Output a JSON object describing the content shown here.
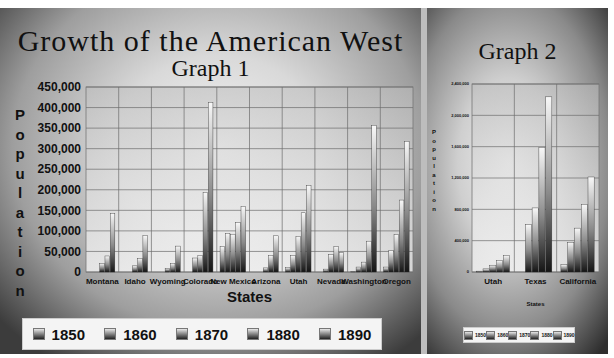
{
  "graph1": {
    "title": "Growth of the American West",
    "subtitle": "Graph 1",
    "ylabel": "Population",
    "xlabel": "States",
    "legend": [
      "1850",
      "1860",
      "1870",
      "1880",
      "1890"
    ]
  },
  "graph2": {
    "title": "Graph 2",
    "ylabel": "Population",
    "xlabel": "States",
    "legend": [
      "1850",
      "1860",
      "1870",
      "1880",
      "1890"
    ]
  },
  "chart_data": [
    {
      "type": "bar",
      "title": "Growth of the American West — Graph 1",
      "xlabel": "States",
      "ylabel": "Population",
      "ylim": [
        0,
        450000
      ],
      "yticks": [
        0,
        50000,
        100000,
        150000,
        200000,
        250000,
        300000,
        350000,
        400000,
        450000
      ],
      "ytick_labels": [
        "0",
        "50,000",
        "100,000",
        "150,000",
        "200,000",
        "250,000",
        "300,000",
        "350,000",
        "400,000",
        "450,000"
      ],
      "grid": true,
      "legend_position": "bottom",
      "categories": [
        "Montana",
        "Idaho",
        "Wyoming",
        "Colorado",
        "New Mexico",
        "Arizona",
        "Utah",
        "Nevada",
        "Washington",
        "Oregon"
      ],
      "series": [
        {
          "name": "1850",
          "values": [
            0,
            0,
            0,
            0,
            62000,
            0,
            11000,
            0,
            1000,
            12000
          ]
        },
        {
          "name": "1860",
          "values": [
            0,
            0,
            0,
            34000,
            94000,
            0,
            40000,
            7000,
            12000,
            52000
          ]
        },
        {
          "name": "1870",
          "values": [
            21000,
            15000,
            9000,
            40000,
            92000,
            10000,
            87000,
            42000,
            24000,
            91000
          ]
        },
        {
          "name": "1880",
          "values": [
            39000,
            33000,
            21000,
            194000,
            120000,
            40000,
            144000,
            62000,
            75000,
            175000
          ]
        },
        {
          "name": "1890",
          "values": [
            143000,
            89000,
            63000,
            413000,
            160000,
            88000,
            211000,
            47000,
            357000,
            318000
          ]
        }
      ]
    },
    {
      "type": "bar",
      "title": "Graph 2",
      "xlabel": "States",
      "ylabel": "Population",
      "ylim": [
        0,
        2400000
      ],
      "yticks": [
        0,
        400000,
        800000,
        1200000,
        1600000,
        2000000,
        2400000
      ],
      "ytick_labels": [
        "0",
        "400,000",
        "800,000",
        "1,200,000",
        "1,600,000",
        "2,000,000",
        "2,400,000"
      ],
      "grid": true,
      "legend_position": "bottom",
      "categories": [
        "Utah",
        "Texas",
        "California"
      ],
      "series": [
        {
          "name": "1850",
          "values": [
            11000,
            0,
            93000
          ]
        },
        {
          "name": "1860",
          "values": [
            40000,
            604000,
            380000
          ]
        },
        {
          "name": "1870",
          "values": [
            87000,
            818000,
            560000
          ]
        },
        {
          "name": "1880",
          "values": [
            144000,
            1592000,
            865000
          ]
        },
        {
          "name": "1890",
          "values": [
            211000,
            2236000,
            1213000
          ]
        }
      ]
    }
  ]
}
